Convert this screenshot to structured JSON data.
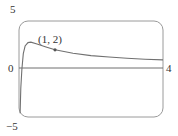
{
  "chart_data": {
    "type": "line",
    "title": "",
    "xlabel": "",
    "ylabel": "",
    "xlim": [
      0,
      4
    ],
    "ylim": [
      -5,
      5
    ],
    "grid": false,
    "legend": null,
    "tick_labels": {
      "x_left": "0",
      "x_right": "4",
      "y_top": "5",
      "y_bottom": "−5"
    },
    "series": [
      {
        "name": "f(x)",
        "x": [
          0.03,
          0.05,
          0.08,
          0.12,
          0.17,
          0.25,
          0.33,
          0.5,
          0.75,
          1.0,
          1.5,
          2.0,
          2.5,
          3.0,
          3.5,
          4.0
        ],
        "y": [
          -4.6,
          -2.0,
          0.0,
          1.6,
          2.4,
          2.75,
          2.8,
          2.6,
          2.3,
          2.0,
          1.65,
          1.4,
          1.25,
          1.12,
          1.02,
          0.95
        ]
      }
    ],
    "annotations": [
      {
        "text": "(1, 2)",
        "x": 1,
        "y": 2,
        "marker": "dot"
      }
    ]
  },
  "labels": {
    "y_top": "5",
    "y_bottom": "−5",
    "x_left": "0",
    "x_right": "4",
    "point": "(1, 2)"
  },
  "colors": {
    "frame": "#9a9a9a",
    "axis": "#6e6e6e",
    "curve": "#707070",
    "text": "#333333"
  }
}
